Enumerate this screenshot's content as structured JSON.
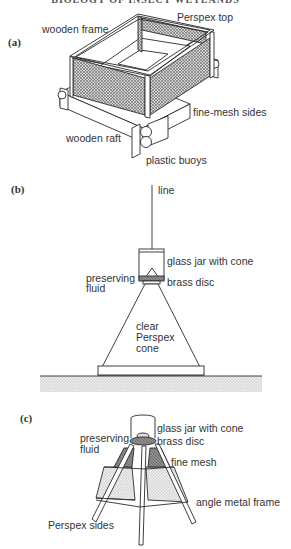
{
  "header": {
    "text": "BIOLOGY OF INSECT WETLANDS"
  },
  "panels": {
    "a": {
      "label": "(a)",
      "title": "Floating emergence trap",
      "annotations": {
        "wooden_frame": "wooden frame",
        "perspex_top": "Perspex top",
        "fine_mesh_sides": "fine-mesh sides",
        "wooden_raft": "wooden raft",
        "plastic_buoys": "plastic buoys"
      }
    },
    "b": {
      "label": "(b)",
      "title": "Submerged funnel trap",
      "annotations": {
        "line": "line",
        "glass_jar": "glass jar with cone",
        "preserving_fluid_1": "preserving",
        "preserving_fluid_2": "fluid",
        "brass_disc": "brass   disc",
        "cone_1": "clear",
        "cone_2": "Perspex",
        "cone_3": "cone"
      }
    },
    "c": {
      "label": "(c)",
      "title": "Pyramid emergence trap",
      "annotations": {
        "glass_jar": "glass jar with cone",
        "preserving_fluid_1": "preserving",
        "preserving_fluid_2": "fluid",
        "brass_disc": "brass disc",
        "fine_mesh": "fine mesh",
        "angle_metal_frame": "angle metal frame",
        "perspex_sides": "Perspex sides"
      }
    }
  },
  "colors": {
    "line": "#2a2a2a",
    "mesh": "#9a9a9a",
    "stipple": "#d8d8d8",
    "dark_mesh": "#7a7a7a"
  }
}
